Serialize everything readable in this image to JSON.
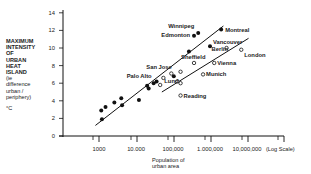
{
  "chart_data": {
    "type": "scatter",
    "title": "",
    "ylabel": "MAXIMUM INTENSITY OF URBAN HEAT ISLAND",
    "ylabel_sub": "(ie difference urban / periphery)",
    "ylabel_unit": "°C",
    "xlabel": "Population of urban area",
    "xscale": "log",
    "xscale_note": "(Log Scale)",
    "xlim": [
      700,
      25000000
    ],
    "ylim": [
      0,
      14
    ],
    "yticks": [
      0,
      2,
      4,
      6,
      8,
      10,
      12,
      14
    ],
    "xticks": [
      {
        "value": 1000,
        "label": "1000"
      },
      {
        "value": 10000,
        "label": "10.000"
      },
      {
        "value": 100000,
        "label": "100,000"
      },
      {
        "value": 1000000,
        "label": "1.000,000"
      },
      {
        "value": 10000000,
        "label": "10,000,000"
      }
    ],
    "grid": false,
    "series": [
      {
        "name": "North American cities",
        "marker": "filled-circle",
        "points": [
          {
            "x": 1200,
            "y": 1.9
          },
          {
            "x": 1150,
            "y": 2.9
          },
          {
            "x": 1500,
            "y": 3.3
          },
          {
            "x": 2600,
            "y": 3.8
          },
          {
            "x": 4000,
            "y": 4.3
          },
          {
            "x": 4200,
            "y": 3.5
          },
          {
            "x": 12000,
            "y": 4.1
          },
          {
            "x": 20000,
            "y": 5.7
          },
          {
            "x": 22000,
            "y": 5.4
          },
          {
            "x": 30000,
            "y": 6.0,
            "label": "Palo Alto"
          },
          {
            "x": 36000,
            "y": 6.2
          },
          {
            "x": 105000,
            "y": 6.8,
            "label": "San Jose"
          },
          {
            "x": 270000,
            "y": 9.6
          },
          {
            "x": 1000000,
            "y": 10.2,
            "label": "Vancouver"
          },
          {
            "x": 370000,
            "y": 11.4,
            "label": "Edmonton"
          },
          {
            "x": 480000,
            "y": 11.7,
            "label": "Winnipeg"
          },
          {
            "x": 2000000,
            "y": 12.1,
            "label": "Montreal"
          }
        ],
        "trendline": {
          "x": [
            800,
            2300000
          ],
          "y": [
            1.2,
            12.5
          ]
        }
      },
      {
        "name": "European cities",
        "marker": "open-circle",
        "points": [
          {
            "x": 45000,
            "y": 5.8
          },
          {
            "x": 55000,
            "y": 6.6
          },
          {
            "x": 130000,
            "y": 6.2
          },
          {
            "x": 90000,
            "y": 7.1,
            "label": "Lund"
          },
          {
            "x": 160000,
            "y": 7.3
          },
          {
            "x": 160000,
            "y": 6.0
          },
          {
            "x": 370000,
            "y": 8.3,
            "label": "Sheffield"
          },
          {
            "x": 160000,
            "y": 4.6,
            "label": "Reading"
          },
          {
            "x": 650000,
            "y": 7.0,
            "label": "Munich"
          },
          {
            "x": 1300000,
            "y": 8.3,
            "label": "Vienna"
          },
          {
            "x": 2800000,
            "y": 10.0,
            "label": "Berlin"
          },
          {
            "x": 7000000,
            "y": 9.8,
            "label": "London"
          }
        ],
        "trendline": {
          "x": [
            50000,
            11000000
          ],
          "y": [
            5.0,
            11.1
          ]
        }
      }
    ],
    "annotations": [
      "Winnipeg",
      "Edmonton",
      "Montreal",
      "Vancouver",
      "Berlin",
      "London",
      "San Jose",
      "Sheffield",
      "Vienna",
      "Palo Alto",
      "Munich",
      "Lund",
      "Reading"
    ]
  },
  "labels": {
    "y_title_lines": [
      "MAXIMUM",
      "INTENSITY",
      "OF",
      "URBAN",
      "HEAT",
      "ISLAND"
    ],
    "y_sub_lines": [
      "(ie",
      "difference",
      "urban /",
      "periphery)"
    ],
    "y_unit": "°C",
    "x_title_lines": [
      "Population of",
      "urban area"
    ]
  }
}
